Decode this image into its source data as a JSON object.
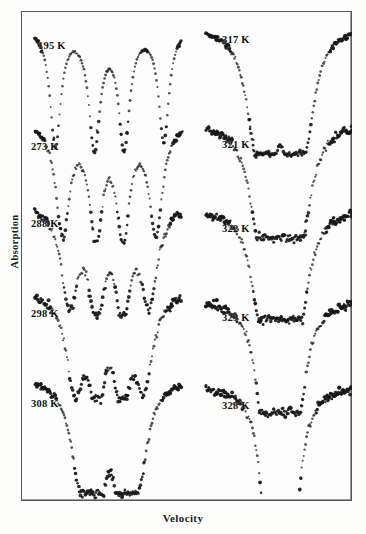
{
  "figure": {
    "axis": {
      "ylabel": "Absorption",
      "xlabel": "Velocity"
    },
    "frame": {
      "border_color": "#585858",
      "background": "#fdfdfd"
    },
    "point_color": "#181818"
  },
  "chart_data": {
    "type": "scatter",
    "title": "",
    "subtitle": "",
    "xlabel": "Velocity",
    "ylabel": "Absorption",
    "xlim": [
      -12,
      12
    ],
    "ylim": [
      0,
      1
    ],
    "grid": false,
    "legend": null,
    "columns": [
      {
        "name": "left-column",
        "spectra": [
          {
            "label": "195 K",
            "label_x": 38,
            "label_y": 40,
            "baseline": 14,
            "depth": 118,
            "noise": 1.0,
            "density": 150,
            "peaks": [
              {
                "center": -5.05,
                "width": 0.62,
                "depth": 1.0
              },
              {
                "center": -1.3,
                "width": 0.66,
                "depth": 1.0
              },
              {
                "center": 1.55,
                "width": 0.64,
                "depth": 1.0
              },
              {
                "center": 5.35,
                "width": 0.6,
                "depth": 0.96
              }
            ]
          },
          {
            "label": "273 K",
            "label_x": 31,
            "label_y": 141,
            "baseline": 108,
            "depth": 112,
            "noise": 3.1,
            "density": 150,
            "peaks": [
              {
                "center": -4.35,
                "width": 0.78,
                "depth": 1.0
              },
              {
                "center": -1.15,
                "width": 0.74,
                "depth": 1.0
              },
              {
                "center": 1.45,
                "width": 0.74,
                "depth": 1.0
              },
              {
                "center": 4.6,
                "width": 0.78,
                "depth": 0.98
              }
            ]
          },
          {
            "label": "288 K",
            "label_x": 31,
            "label_y": 218,
            "baseline": 190,
            "depth": 105,
            "noise": 4.0,
            "density": 152,
            "peaks": [
              {
                "center": -3.7,
                "width": 0.95,
                "depth": 0.92
              },
              {
                "center": -1.1,
                "width": 0.8,
                "depth": 1.0
              },
              {
                "center": 1.4,
                "width": 0.8,
                "depth": 1.0
              },
              {
                "center": 3.95,
                "width": 0.95,
                "depth": 0.9
              }
            ]
          },
          {
            "label": "298 K",
            "label_x": 31,
            "label_y": 308,
            "baseline": 277,
            "depth": 103,
            "noise": 4.4,
            "density": 152,
            "peaks": [
              {
                "center": -3.2,
                "width": 1.0,
                "depth": 0.88
              },
              {
                "center": -1.05,
                "width": 0.82,
                "depth": 1.0
              },
              {
                "center": 1.35,
                "width": 0.82,
                "depth": 1.0
              },
              {
                "center": 3.45,
                "width": 1.0,
                "depth": 0.86
              }
            ]
          },
          {
            "label": "308 K",
            "label_x": 31,
            "label_y": 398,
            "baseline": 364,
            "depth": 110,
            "noise": 4.2,
            "density": 152,
            "peaks": [
              {
                "center": -2.7,
                "width": 1.05,
                "depth": 0.8
              },
              {
                "center": -1.0,
                "width": 0.84,
                "depth": 1.0
              },
              {
                "center": 1.3,
                "width": 0.84,
                "depth": 1.0
              },
              {
                "center": 2.95,
                "width": 1.05,
                "depth": 0.78
              }
            ]
          }
        ]
      },
      {
        "name": "right-column",
        "spectra": [
          {
            "label": "317 K",
            "label_x": 222,
            "label_y": 34,
            "baseline": 13,
            "depth": 120,
            "noise": 3.0,
            "density": 150,
            "peaks": [
              {
                "center": -2.3,
                "width": 1.1,
                "depth": 0.72
              },
              {
                "center": -0.95,
                "width": 0.86,
                "depth": 1.0
              },
              {
                "center": 1.25,
                "width": 0.86,
                "depth": 1.0
              },
              {
                "center": 2.55,
                "width": 1.1,
                "depth": 0.7
              }
            ]
          },
          {
            "label": "321 K",
            "label_x": 222,
            "label_y": 139,
            "baseline": 110,
            "depth": 108,
            "noise": 4.2,
            "density": 152,
            "peaks": [
              {
                "center": -2.0,
                "width": 1.15,
                "depth": 0.66
              },
              {
                "center": -0.9,
                "width": 0.88,
                "depth": 1.0
              },
              {
                "center": 1.2,
                "width": 0.88,
                "depth": 1.0
              },
              {
                "center": 2.25,
                "width": 1.15,
                "depth": 0.64
              }
            ]
          },
          {
            "label": "322 K",
            "label_x": 222,
            "label_y": 223,
            "baseline": 196,
            "depth": 104,
            "noise": 4.6,
            "density": 152,
            "peaks": [
              {
                "center": -1.75,
                "width": 1.1,
                "depth": 0.7
              },
              {
                "center": -0.85,
                "width": 0.86,
                "depth": 1.0
              },
              {
                "center": 1.15,
                "width": 0.86,
                "depth": 1.0
              },
              {
                "center": 2.0,
                "width": 1.1,
                "depth": 0.68
              }
            ]
          },
          {
            "label": "323 K",
            "label_x": 222,
            "label_y": 312,
            "baseline": 285,
            "depth": 108,
            "noise": 5.0,
            "density": 152,
            "peaks": [
              {
                "center": -1.3,
                "width": 1.05,
                "depth": 0.8
              },
              {
                "center": -0.7,
                "width": 0.82,
                "depth": 1.0
              },
              {
                "center": 1.0,
                "width": 0.82,
                "depth": 1.0
              },
              {
                "center": 1.55,
                "width": 1.05,
                "depth": 0.78
              }
            ]
          },
          {
            "label": "328 K",
            "label_x": 222,
            "label_y": 400,
            "baseline": 373,
            "depth": 118,
            "noise": 4.4,
            "density": 152,
            "peaks": [
              {
                "center": -0.95,
                "width": 0.78,
                "depth": 1.0
              },
              {
                "center": -0.6,
                "width": 0.7,
                "depth": 1.0
              },
              {
                "center": 0.85,
                "width": 0.7,
                "depth": 1.0
              },
              {
                "center": 1.2,
                "width": 0.78,
                "depth": 1.0
              }
            ]
          }
        ]
      }
    ]
  }
}
